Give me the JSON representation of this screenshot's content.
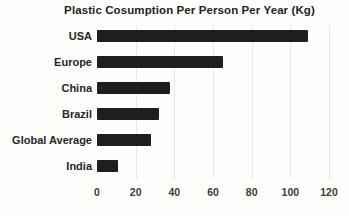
{
  "chart_data": {
    "type": "bar",
    "orientation": "horizontal",
    "title": "Plastic Cosumption Per Person Per Year (Kg)",
    "categories": [
      "USA",
      "Europe",
      "China",
      "Brazil",
      "Global Average",
      "India"
    ],
    "values": [
      109,
      65,
      38,
      32,
      28,
      11
    ],
    "xlabel": "",
    "ylabel": "",
    "xlim": [
      0,
      120
    ],
    "xticks": [
      0,
      20,
      40,
      60,
      80,
      100,
      120
    ],
    "grid": "vertical-light",
    "legend": "none",
    "colors": {
      "bar": "#1e1e1e",
      "gridline": "#e9e6e4",
      "title_text": "#1f1f1f",
      "category_text": "#262626",
      "tick_text": "#3b3b3b",
      "background": "#fdfdfc"
    }
  }
}
